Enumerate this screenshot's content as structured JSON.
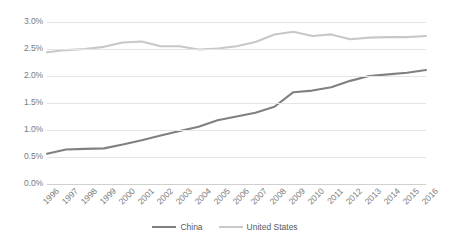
{
  "chart_data": {
    "type": "line",
    "title": "",
    "xlabel": "",
    "ylabel": "",
    "ylim": [
      0,
      3.0
    ],
    "y_tick_format": "percent",
    "y_ticks": [
      "0.0%",
      "0.5%",
      "1.0%",
      "1.5%",
      "2.0%",
      "2.5%",
      "3.0%"
    ],
    "y_tick_values": [
      0.0,
      0.5,
      1.0,
      1.5,
      2.0,
      2.5,
      3.0
    ],
    "grid": true,
    "legend_position": "bottom",
    "categories": [
      "1996",
      "1997",
      "1998",
      "1999",
      "2000",
      "2001",
      "2002",
      "2003",
      "2004",
      "2005",
      "2006",
      "2007",
      "2008",
      "2009",
      "2010",
      "2011",
      "2012",
      "2013",
      "2014",
      "2015",
      "2016"
    ],
    "series": [
      {
        "name": "China",
        "color": "#808080",
        "values": [
          0.56,
          0.64,
          0.65,
          0.66,
          0.73,
          0.81,
          0.9,
          0.98,
          1.06,
          1.18,
          1.25,
          1.32,
          1.43,
          1.7,
          1.73,
          1.79,
          1.91,
          2.0,
          2.03,
          2.06,
          2.11
        ]
      },
      {
        "name": "United States",
        "color": "#c8c8c8",
        "values": [
          2.44,
          2.48,
          2.5,
          2.54,
          2.62,
          2.64,
          2.55,
          2.55,
          2.49,
          2.51,
          2.55,
          2.63,
          2.77,
          2.82,
          2.74,
          2.77,
          2.68,
          2.71,
          2.72,
          2.72,
          2.74
        ]
      }
    ]
  },
  "legend": {
    "items": [
      {
        "label": "China",
        "color": "#808080"
      },
      {
        "label": "United States",
        "color": "#c8c8c8"
      }
    ]
  }
}
